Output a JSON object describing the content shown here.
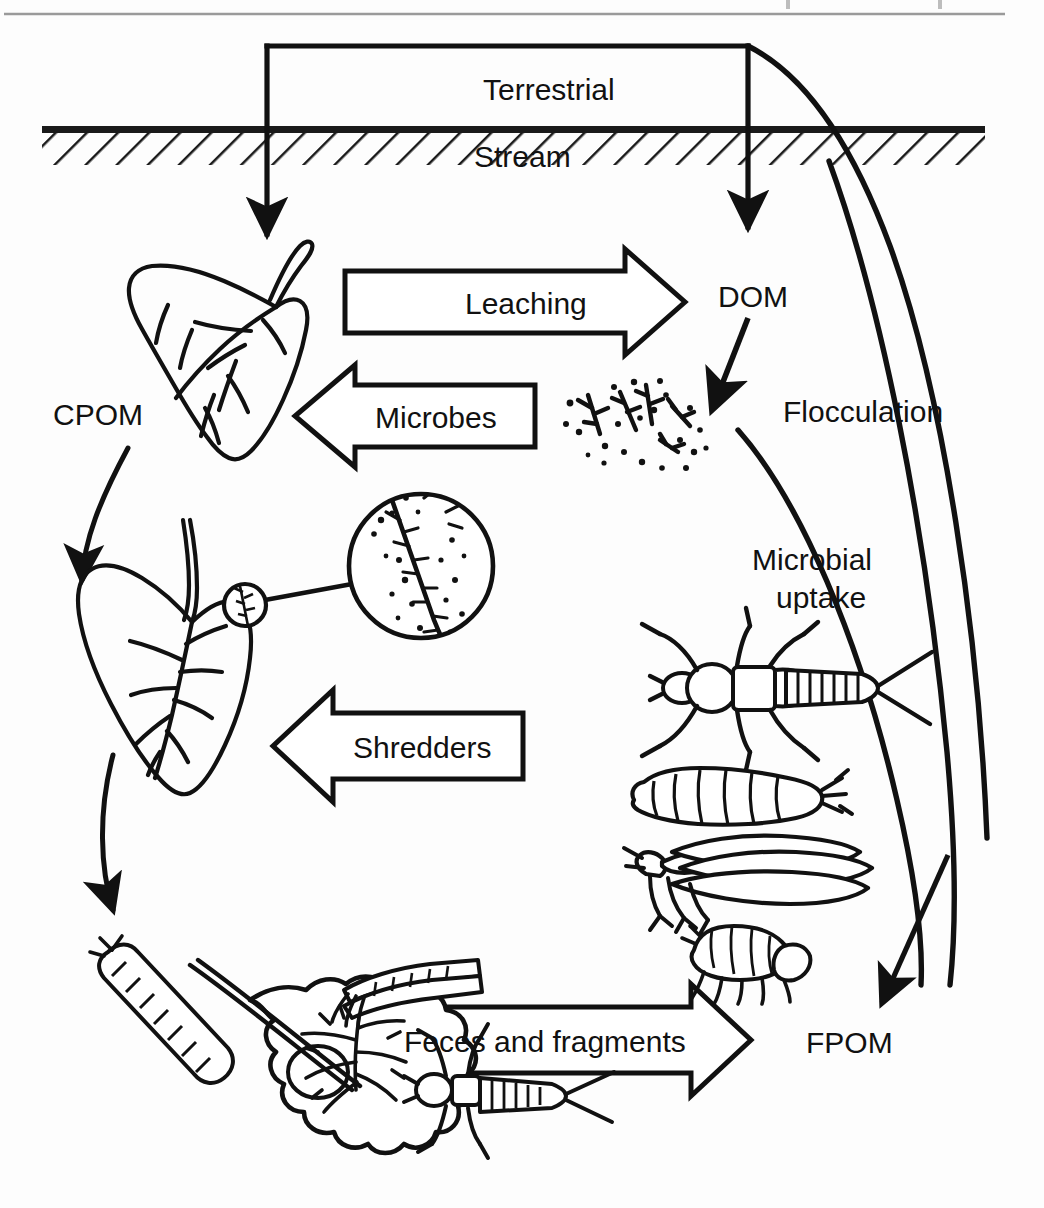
{
  "figure": {
    "name": "stream-organic-matter-processing",
    "background_color": "#fdfdfd",
    "ink_color": "#111111",
    "width": 1044,
    "height": 1208
  },
  "top_rule": {
    "present": true,
    "color": "#8a8a8a"
  },
  "zones": {
    "terrestrial": {
      "label": "Terrestrial",
      "x": 483,
      "y": 87,
      "font_size": 30
    },
    "stream": {
      "label": "Stream",
      "x": 474,
      "y": 155,
      "font_size": 30
    }
  },
  "pool_labels": [
    {
      "id": "cpom",
      "label": "CPOM",
      "x": 53,
      "y": 400,
      "font_size": 30
    },
    {
      "id": "dom",
      "label": "DOM",
      "x": 718,
      "y": 282,
      "font_size": 30
    },
    {
      "id": "fpom",
      "label": "FPOM",
      "x": 806,
      "y": 1029,
      "font_size": 30
    }
  ],
  "process_labels": [
    {
      "id": "flocculation",
      "label": "Flocculation",
      "x": 783,
      "y": 397,
      "font_size": 30
    },
    {
      "id": "microbial-uptake",
      "line1": "Microbial",
      "line2": "uptake",
      "x": 752,
      "y": 545,
      "font_size": 30
    }
  ],
  "block_arrows": [
    {
      "id": "leaching",
      "label": "Leaching",
      "direction": "right",
      "x": 345,
      "y": 271,
      "width": 340,
      "height": 62,
      "label_x": 465,
      "label_y": 285,
      "font_size": 30
    },
    {
      "id": "microbes",
      "label": "Microbes",
      "direction": "left",
      "x": 295,
      "y": 385,
      "width": 240,
      "height": 62,
      "label_x": 375,
      "label_y": 399,
      "font_size": 30
    },
    {
      "id": "shredders",
      "label": "Shredders",
      "direction": "left",
      "x": 273,
      "y": 713,
      "width": 250,
      "height": 66,
      "label_x": 353,
      "label_y": 730,
      "font_size": 30
    },
    {
      "id": "feces-and-fragments",
      "label": "Feces and fragments",
      "direction": "right",
      "x": 379,
      "y": 1007,
      "width": 372,
      "height": 66,
      "label_x": 404,
      "label_y": 1024,
      "font_size": 30
    }
  ],
  "connectors": [
    {
      "id": "terrestrial-input-to-cpom",
      "kind": "bracket-arrow",
      "target": "cpom-leaf"
    },
    {
      "id": "terrestrial-input-to-dom",
      "kind": "bracket-arrow",
      "target": "dom"
    },
    {
      "id": "dom-to-floc",
      "kind": "arrow"
    },
    {
      "id": "cpom-to-conditioned-leaf",
      "kind": "curved-arrow"
    },
    {
      "id": "conditioned-leaf-to-shredded-leaf",
      "kind": "curved-arrow"
    },
    {
      "id": "floc-to-fpom",
      "kind": "curved-arrow"
    },
    {
      "id": "fpom-to-terrestrial-1",
      "kind": "long-curve"
    },
    {
      "id": "fpom-to-terrestrial-2",
      "kind": "long-curve"
    },
    {
      "id": "invertebrates-to-fpom",
      "kind": "arrow"
    }
  ],
  "illustrations": [
    {
      "id": "intact-leaf",
      "name": "whole-leaf-drawing",
      "x": 120,
      "y": 240
    },
    {
      "id": "conditioned-leaf",
      "name": "conditioned-leaf-drawing",
      "x": 100,
      "y": 570
    },
    {
      "id": "magnifier-small-circle",
      "name": "magnifier-source-circle",
      "x": 245,
      "y": 605,
      "r": 22
    },
    {
      "id": "magnifier-big-circle",
      "name": "magnifier-detail-circle",
      "x": 421,
      "y": 566,
      "r": 73
    },
    {
      "id": "floc-particles",
      "name": "flocculated-particles",
      "x": 640,
      "y": 418
    },
    {
      "id": "stonefly-nymph",
      "name": "stonefly-nymph-drawing",
      "x": 748,
      "y": 672
    },
    {
      "id": "cranefly-larva",
      "name": "cranefly-larva-drawing",
      "x": 738,
      "y": 795
    },
    {
      "id": "caddisfly-adult",
      "name": "caddisfly-adult-drawing",
      "x": 748,
      "y": 872
    },
    {
      "id": "pupa",
      "name": "pupa-drawing",
      "x": 740,
      "y": 950
    },
    {
      "id": "shredded-leaf-assemblage",
      "name": "shredded-leaf-with-invertebrates",
      "x": 230,
      "y": 1040
    }
  ]
}
